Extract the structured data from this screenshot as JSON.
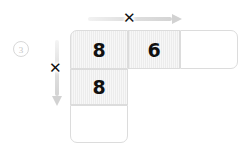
{
  "page": {
    "background_color": "#ffffff",
    "width": 250,
    "height": 152
  },
  "step_marker": {
    "label": "3",
    "color": "#c6c6c6"
  },
  "arrows": {
    "horizontal": {
      "name": "horizontal-multiply-arrow",
      "direction": "right",
      "operator": "✕",
      "color": "#d4d4d4"
    },
    "vertical": {
      "name": "vertical-multiply-arrow",
      "direction": "down",
      "operator": "✕",
      "color": "#d4d4d4"
    }
  },
  "grid": {
    "top_row": [
      {
        "value": "8",
        "filled": true
      },
      {
        "value": "6",
        "filled": true
      },
      {
        "value": "",
        "filled": false
      }
    ],
    "left_column": [
      {
        "value": "8",
        "filled": true
      },
      {
        "value": "",
        "filled": false
      }
    ]
  },
  "colors": {
    "cell_border": "#dcdcdc",
    "cell_fill": "#f2f2f2",
    "digit": "#111111",
    "arrow": "#d4d4d4"
  }
}
